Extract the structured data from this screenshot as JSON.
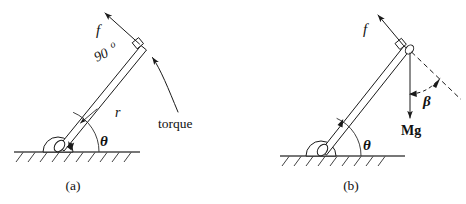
{
  "figure": {
    "name": "torque-on-rod-diagram",
    "background_color": "#ffffff",
    "ink_color": "#1a1a1a",
    "panels": [
      {
        "id": "a",
        "caption": "(a)",
        "labels": {
          "force": "f",
          "right_angle": "90",
          "degree_symbol": "o",
          "radius": "r",
          "angle": "θ",
          "torque": "torque"
        },
        "elements": [
          "hinged-rod",
          "ground-hatching",
          "pivot-mount",
          "force-arrow",
          "right-angle-marker",
          "radius-arrow",
          "theta-angle-arc",
          "torque-curved-arrow"
        ]
      },
      {
        "id": "b",
        "caption": "(b)",
        "labels": {
          "force": "f",
          "weight": "Mg",
          "angle": "θ",
          "beta_angle": "β"
        },
        "elements": [
          "hinged-rod",
          "ground-hatching",
          "pivot-mount",
          "force-arrow",
          "right-angle-marker",
          "weight-arrow",
          "rod-extension-dashed",
          "beta-angle-dashed-arc",
          "theta-angle-arc"
        ]
      }
    ]
  }
}
